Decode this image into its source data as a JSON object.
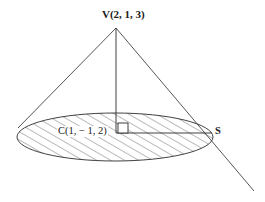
{
  "figure": {
    "kind": "geometry-diagram",
    "stroke_color": "#2b2b2b",
    "background_color": "#ffffff",
    "hatch_color": "#3a3a3a"
  },
  "labels": {
    "vertex": "V(2, 1, 3)",
    "center": "C(1, − 1, 2)",
    "slant_point": "S"
  },
  "points": {
    "vertex": {
      "name": "V",
      "x": 116,
      "y": 28,
      "coords": "(2, 1, 3)"
    },
    "center": {
      "name": "C",
      "x": 116,
      "y": 133,
      "coords": "(1, − 1, 2)"
    },
    "slant_point": {
      "name": "S",
      "x": 212,
      "y": 133,
      "coords": ""
    }
  },
  "base": {
    "shape": "ellipse",
    "cx": 115,
    "cy": 137,
    "rx": 98,
    "ry": 24,
    "hatched": true,
    "hatch_spacing": 7,
    "hatch_angle_deg": 60
  },
  "segments": [
    {
      "name": "axis",
      "from": "V",
      "to": "C",
      "x1": 116,
      "y1": 28,
      "x2": 116,
      "y2": 133
    },
    {
      "name": "left-slant",
      "from": "V",
      "to": "base-left",
      "x1": 116,
      "y1": 28,
      "x2": 18,
      "y2": 128
    },
    {
      "name": "right-slant-extended",
      "from": "V",
      "to": "beyond-S",
      "x1": 116,
      "y1": 28,
      "x2": 254,
      "y2": 191
    },
    {
      "name": "radius",
      "from": "C",
      "to": "S",
      "x1": 116,
      "y1": 133,
      "x2": 212,
      "y2": 133
    }
  ],
  "markers": {
    "right_angle": {
      "name": "right-angle-marker",
      "x": 118,
      "y": 123,
      "size": 10
    }
  }
}
